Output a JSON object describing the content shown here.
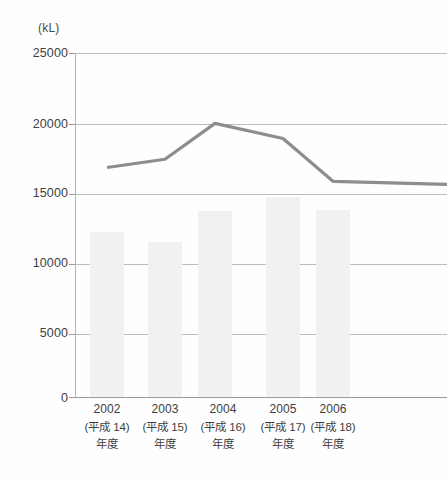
{
  "chart_data": {
    "type": "bar",
    "title": "",
    "subtitle": "",
    "unit_label": "(kL)",
    "xlabel": "",
    "ylabel": "",
    "ylim": [
      0,
      25000
    ],
    "ytick_values": [
      0,
      5000,
      10000,
      15000,
      20000,
      25000
    ],
    "ytick_labels": [
      "0",
      "5000",
      "10000",
      "15000",
      "20000",
      "25000"
    ],
    "grid": true,
    "legend": "none",
    "categories": [
      "2002",
      "2003",
      "2004",
      "2005",
      "2006"
    ],
    "category_labels": [
      {
        "year": "2002",
        "era": "(平成 14)",
        "nendo": "年度"
      },
      {
        "year": "2003",
        "era": "(平成 15)",
        "nendo": "年度"
      },
      {
        "year": "2004",
        "era": "(平成 16)",
        "nendo": "年度"
      },
      {
        "year": "2005",
        "era": "(平成 17)",
        "nendo": "年度"
      },
      {
        "year": "2006",
        "era": "(平成 18)",
        "nendo": "年度"
      }
    ],
    "series": [
      {
        "name": "bars",
        "type": "bar",
        "color": "#f1f1f1",
        "values": [
          12000,
          11300,
          13550,
          14600,
          13600
        ]
      },
      {
        "name": "line",
        "type": "line",
        "color": "#8d8d8d",
        "values": [
          16700,
          17300,
          19900,
          18800,
          15700
        ]
      }
    ]
  },
  "colors": {
    "bar_fill": "#f1f1f1",
    "line_stroke": "#8d8d8d",
    "gridline": "#bdbdbd",
    "axis": "#9a9a9a",
    "text": "#3f3f3f",
    "background": "#fefefe"
  }
}
